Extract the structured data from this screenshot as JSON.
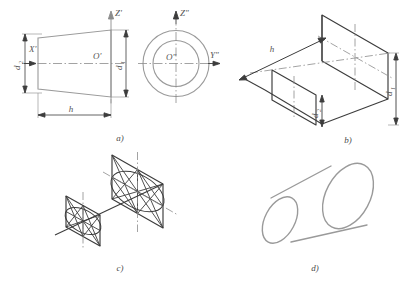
{
  "figure": {
    "background_color": "#ffffff",
    "line_color_light": "#9a9a9a",
    "line_color_dark": "#3c3c3c",
    "axis_color": "#8c8c8c",
    "text_color": "#555555"
  },
  "panels": [
    {
      "id": "a",
      "caption": "a)",
      "description": "Orthographic front view and side view of the truncated cone with axes and dimensions"
    },
    {
      "id": "b",
      "caption": "b)",
      "description": "Isometric axonometric construction: two square frames at distance h along the axis"
    },
    {
      "id": "c",
      "caption": "c)",
      "description": "Four-centre ellipse construction inscribed in the isometric rhombi"
    },
    {
      "id": "d",
      "caption": "d)",
      "description": "Finished isometric projection of the truncated cone"
    }
  ],
  "view_a": {
    "axis_z_label": "Z'",
    "axis_x_label": "X'",
    "origin_label": "O'",
    "dim_height_label": "h",
    "dim_large_diameter_label": "d",
    "dim_large_diameter_sub": "1",
    "dim_small_diameter_label": "d",
    "dim_small_diameter_sub": "2"
  },
  "view_side": {
    "axis_z_label": "Z\"",
    "axis_y_label": "Y\"",
    "origin_label": "O\"",
    "circles": [
      "outer circle = d1",
      "inner circle = d2"
    ]
  },
  "view_b": {
    "dim_height_label": "h",
    "dim_large_diameter_label": "d",
    "dim_large_diameter_sub": "1",
    "dim_small_diameter_label": "d",
    "dim_small_diameter_sub": "2"
  }
}
